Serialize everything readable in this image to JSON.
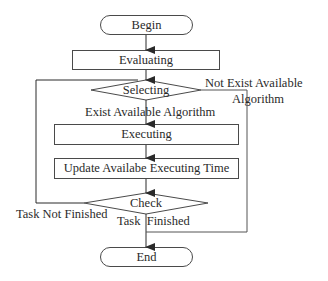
{
  "diagram": {
    "type": "flowchart",
    "nodes": {
      "begin": {
        "label": "Begin",
        "shape": "terminator"
      },
      "evaluating": {
        "label": "Evaluating",
        "shape": "process"
      },
      "selecting": {
        "label": "Selecting",
        "shape": "decision"
      },
      "executing": {
        "label": "Executing",
        "shape": "process"
      },
      "update": {
        "label": "Update Availabe Executing Time",
        "shape": "process"
      },
      "check": {
        "label": "Check",
        "shape": "decision"
      },
      "end": {
        "label": "End",
        "shape": "terminator"
      }
    },
    "edge_labels": {
      "exist_available": "Exist Available Algorithm",
      "not_exist_line1": "Not Exist Available",
      "not_exist_line2": "Algorithm",
      "task_not_finished": "Task Not Finished",
      "task_finished": "Task  Finished"
    },
    "edges": [
      {
        "from": "begin",
        "to": "evaluating"
      },
      {
        "from": "evaluating",
        "to": "selecting"
      },
      {
        "from": "selecting",
        "to": "executing",
        "label": "Exist Available Algorithm"
      },
      {
        "from": "selecting",
        "to": "end",
        "label": "Not Exist Available Algorithm"
      },
      {
        "from": "executing",
        "to": "update"
      },
      {
        "from": "update",
        "to": "check"
      },
      {
        "from": "check",
        "to": "selecting",
        "label": "Task Not Finished"
      },
      {
        "from": "check",
        "to": "end",
        "label": "Task Finished"
      }
    ],
    "colors": {
      "line": "#3a3a3a",
      "text": "#2a2a2a",
      "background": "#ffffff"
    }
  }
}
